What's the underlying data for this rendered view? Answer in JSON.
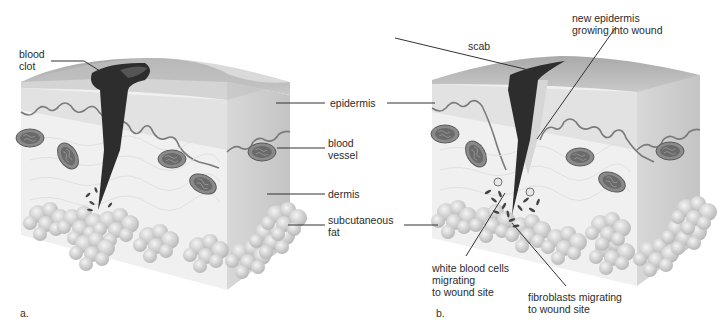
{
  "figure": {
    "panels": [
      {
        "id": "a",
        "letter": "a.",
        "title": "Wound with blood clot",
        "labels": {
          "blood_clot": "blood\nclot"
        }
      },
      {
        "id": "b",
        "letter": "b.",
        "labels": {
          "scab": "scab",
          "new_epidermis": "new epidermis\ngrowing into wound",
          "white_blood_cells": "white blood cells\nmigrating\nto wound site",
          "fibroblasts": "fibroblasts migrating\nto wound site"
        }
      }
    ],
    "shared_labels": {
      "epidermis": "epidermis",
      "blood_vessel": "blood\nvessel",
      "dermis": "dermis",
      "subcutaneous_fat": "subcutaneous\nfat"
    },
    "colors": {
      "epidermis_top": "#b9b9b9",
      "epidermis_front": "#e4e4e4",
      "dermis": "#f1f1f1",
      "side_face": "#cfcfcf",
      "clot": "#2c2c2c",
      "vessel": "#7a7a7a",
      "fat": "#d6d6d6",
      "leader": "#333333"
    }
  }
}
